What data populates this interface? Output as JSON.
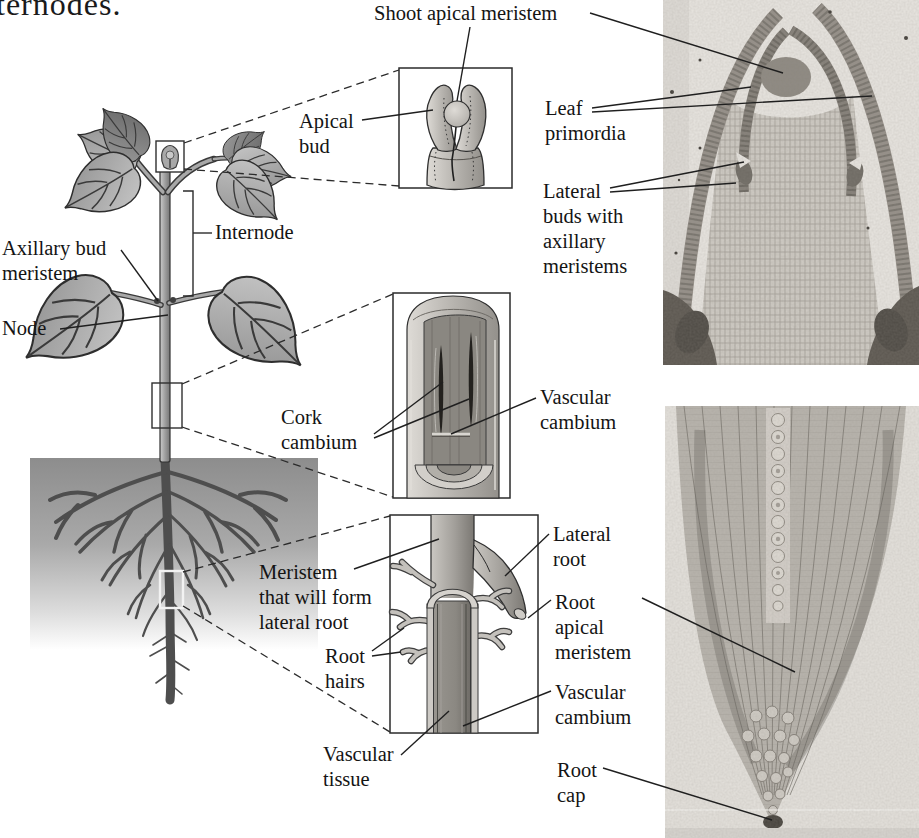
{
  "page": {
    "cropped_sentence_fragment": "ternodes.",
    "background_color": "#ffffff",
    "ink_color": "#141414",
    "leader_line_color": "#2b2b2b"
  },
  "labels": {
    "shoot_apical_meristem": {
      "lines": [
        "Shoot apical meristem"
      ]
    },
    "apical_bud": {
      "lines": [
        "Apical",
        "bud"
      ]
    },
    "internode": {
      "lines": [
        "Internode"
      ]
    },
    "axillary_bud_meristem": {
      "lines": [
        "Axillary bud",
        "meristem"
      ]
    },
    "node": {
      "lines": [
        "Node"
      ]
    },
    "leaf_primordia": {
      "lines": [
        "Leaf",
        "primordia"
      ]
    },
    "lateral_buds_with_axillary_meristems": {
      "lines": [
        "Lateral",
        "buds with",
        "axillary",
        "meristems"
      ]
    },
    "cork_cambium": {
      "lines": [
        "Cork",
        "cambium"
      ]
    },
    "vascular_cambium_stem": {
      "lines": [
        "Vascular",
        "cambium"
      ]
    },
    "meristem_that_will_form_lateral_root": {
      "lines": [
        "Meristem",
        "that will form",
        "lateral root"
      ]
    },
    "root_hairs": {
      "lines": [
        "Root",
        "hairs"
      ]
    },
    "vascular_tissue": {
      "lines": [
        "Vascular",
        "tissue"
      ]
    },
    "lateral_root": {
      "lines": [
        "Lateral",
        "root"
      ]
    },
    "root_apical_meristem": {
      "lines": [
        "Root",
        "apical",
        "meristem"
      ]
    },
    "vascular_cambium_root": {
      "lines": [
        "Vascular",
        "cambium"
      ]
    },
    "root_cap": {
      "lines": [
        "Root",
        "cap"
      ]
    }
  },
  "illustrations": {
    "plant_drawing": "dicot seedling with leaves, stem and roots in soil",
    "apical_bud_inset": "shoot tip: leaf primordia around apical meristem dome",
    "stem_inset": "stem cutaway: cork cambium and vascular cambium",
    "root_inset": "root segment: lateral root, root hairs, vascular tissue",
    "top_micrograph": "longitudinal section of shoot apex",
    "bottom_micrograph": "longitudinal section of root tip"
  }
}
